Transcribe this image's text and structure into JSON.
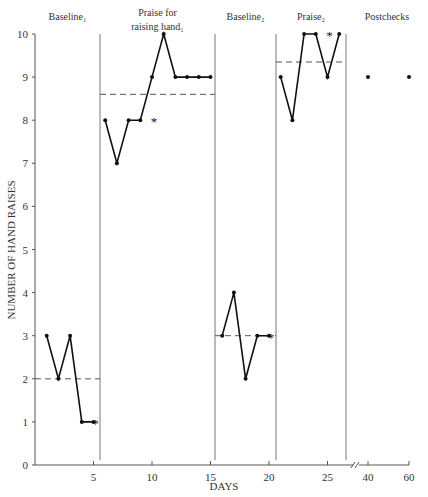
{
  "chart_data": {
    "type": "line",
    "title": "",
    "xlabel": "DAYS",
    "ylabel": "NUMBER OF HAND RAISES",
    "ylim": [
      0,
      10
    ],
    "yticks": [
      0,
      1,
      2,
      3,
      4,
      5,
      6,
      7,
      8,
      9,
      10
    ],
    "xticks": [
      "5",
      "10",
      "15",
      "20",
      "25",
      "40",
      "60"
    ],
    "grid": false,
    "axis_break_between": [
      27,
      40
    ],
    "phases": [
      {
        "name": "Baseline",
        "subscript": "1",
        "label_lines": [
          "Baseline₁"
        ],
        "days": [
          1,
          2,
          3,
          4,
          5
        ],
        "values": [
          3,
          2,
          3,
          1,
          1
        ],
        "mean": 2.0,
        "asterisk_points": [
          {
            "day": 5,
            "value": 1
          }
        ]
      },
      {
        "name": "Praise for raising hand",
        "subscript": "1",
        "label_lines": [
          "Praise for",
          "raising hand₁"
        ],
        "days": [
          6,
          7,
          8,
          9,
          10,
          11,
          12,
          13,
          14,
          15
        ],
        "values": [
          8,
          7,
          8,
          8,
          9,
          10,
          9,
          9,
          9,
          9
        ],
        "mean": 8.6,
        "asterisk_points": [
          {
            "day": 10,
            "value": 8
          }
        ]
      },
      {
        "name": "Baseline",
        "subscript": "2",
        "label_lines": [
          "Baseline₂"
        ],
        "days": [
          16,
          17,
          18,
          19,
          20
        ],
        "values": [
          3,
          4,
          2,
          3,
          3
        ],
        "mean": 3.0,
        "asterisk_points": [
          {
            "day": 20,
            "value": 3
          }
        ]
      },
      {
        "name": "Praise",
        "subscript": "2",
        "label_lines": [
          "Praise₂"
        ],
        "days": [
          21,
          22,
          23,
          24,
          25,
          26
        ],
        "values": [
          9,
          8,
          10,
          10,
          9,
          10
        ],
        "mean": 9.35,
        "asterisk_points": [
          {
            "day": 25,
            "value": 10
          }
        ]
      },
      {
        "name": "Postchecks",
        "subscript": "",
        "label_lines": [
          "Postchecks"
        ],
        "days": [
          40,
          60
        ],
        "values": [
          9,
          9
        ],
        "mean": null,
        "connected": false,
        "asterisk_points": []
      }
    ],
    "phase_dividers_days": [
      5.5,
      15.5,
      20.5,
      26.8
    ],
    "colors": {
      "line": "#111111",
      "axis": "#555555",
      "divider": "#777777",
      "mean": "#555555"
    }
  }
}
